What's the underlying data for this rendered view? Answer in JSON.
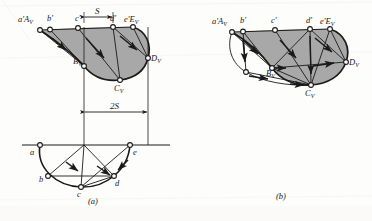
{
  "figure": {
    "title_a": "(a)",
    "title_b": "(b)",
    "fill_color": "#a8a8a8",
    "line_color": "#1a1a1a",
    "paper_color": "#fdfdfb"
  },
  "figure_a": {
    "top_view_labels": [
      {
        "id": "aA",
        "text": "a'A",
        "sub": "V",
        "x": 18,
        "y": 22
      },
      {
        "id": "b",
        "text": "b'",
        "sub": "",
        "x": 50,
        "y": 21
      },
      {
        "id": "c",
        "text": "c'",
        "sub": "",
        "x": 78,
        "y": 21
      },
      {
        "id": "d",
        "text": "d'",
        "sub": "",
        "x": 113,
        "y": 21
      },
      {
        "id": "e",
        "text": "e'E",
        "sub": "V",
        "x": 125,
        "y": 22
      }
    ],
    "lower_labels": [
      {
        "id": "BV",
        "text": "B",
        "sub": "V",
        "x": 84,
        "y": 62
      },
      {
        "id": "CV",
        "text": "C",
        "sub": "V",
        "x": 119,
        "y": 78
      },
      {
        "id": "DV",
        "text": "D",
        "sub": "V",
        "x": 144,
        "y": 63
      }
    ],
    "bottom_view_labels": [
      {
        "id": "a",
        "text": "a",
        "sub": "",
        "x": 33,
        "y": 152
      },
      {
        "id": "b",
        "text": "b",
        "sub": "",
        "x": 43,
        "y": 178
      },
      {
        "id": "c",
        "text": "c",
        "sub": "",
        "x": 79,
        "y": 190
      },
      {
        "id": "d",
        "text": "d",
        "sub": "",
        "x": 116,
        "y": 181
      },
      {
        "id": "e",
        "text": "e",
        "sub": "",
        "x": 137,
        "y": 152
      }
    ],
    "dimensions": [
      {
        "id": "S",
        "text": "S",
        "x": 93,
        "y": 17
      },
      {
        "id": "2S",
        "text": "2S",
        "x": 109,
        "y": 106
      }
    ]
  },
  "figure_b": {
    "top_view_labels": [
      {
        "id": "aA",
        "text": "a'A",
        "sub": "V",
        "x": 221,
        "y": 24
      },
      {
        "id": "b",
        "text": "b'",
        "sub": "",
        "x": 246,
        "y": 23
      },
      {
        "id": "c",
        "text": "c'",
        "sub": "",
        "x": 275,
        "y": 23
      },
      {
        "id": "d",
        "text": "d'",
        "sub": "",
        "x": 309,
        "y": 23
      },
      {
        "id": "e",
        "text": "e'E",
        "sub": "V",
        "x": 320,
        "y": 24
      }
    ],
    "lower_labels": [
      {
        "id": "BV",
        "text": "B",
        "sub": "V",
        "x": 272,
        "y": 66
      },
      {
        "id": "CV",
        "text": "C",
        "sub": "V",
        "x": 306,
        "y": 86
      },
      {
        "id": "DV",
        "text": "D",
        "sub": "V",
        "x": 344,
        "y": 65
      }
    ]
  }
}
